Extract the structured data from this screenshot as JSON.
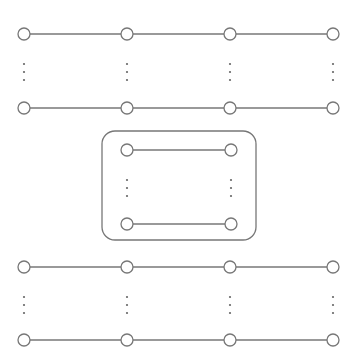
{
  "diagram": {
    "type": "lattice-network",
    "colors": {
      "stroke": "#777777",
      "node_fill": "#ffffff",
      "dots": "#666666",
      "background": "#ffffff"
    },
    "node_radius": 6,
    "columns_x": [
      24,
      127,
      230,
      333
    ],
    "top_group": {
      "rows_y": [
        34,
        108
      ],
      "ellipsis_y": [
        64,
        72,
        80
      ]
    },
    "inner_box": {
      "x": 102,
      "y": 131,
      "width": 154,
      "height": 109,
      "radius": 13,
      "columns_x": [
        127,
        231
      ],
      "rows_y": [
        150,
        224
      ],
      "ellipsis_y": [
        180,
        188,
        196
      ]
    },
    "bottom_group": {
      "rows_y": [
        267,
        340
      ],
      "ellipsis_y": [
        297,
        305,
        313
      ]
    }
  }
}
